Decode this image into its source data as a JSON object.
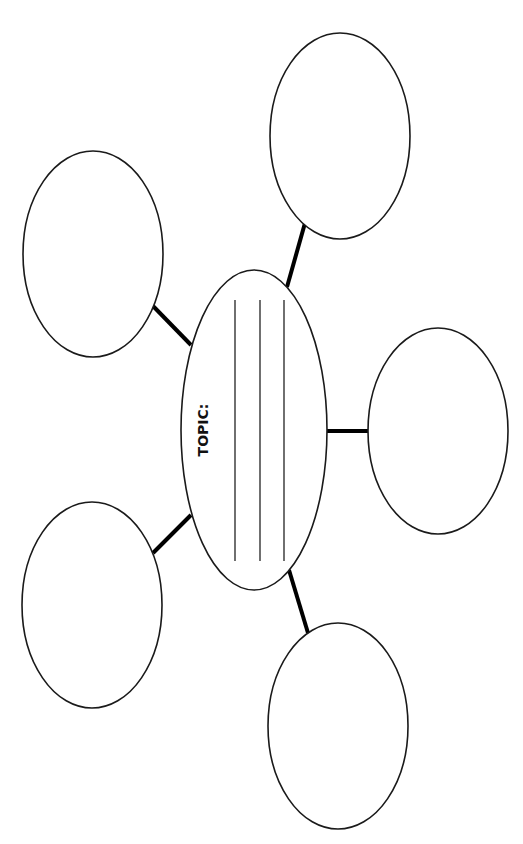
{
  "diagram": {
    "type": "bubble-map",
    "center": {
      "label": "TOPIC:",
      "writing_lines": 3
    },
    "bubbles": [
      {
        "position": "top-right",
        "text": ""
      },
      {
        "position": "top-left",
        "text": ""
      },
      {
        "position": "right",
        "text": ""
      },
      {
        "position": "bottom-left",
        "text": ""
      },
      {
        "position": "bottom-right",
        "text": ""
      }
    ],
    "colors": {
      "stroke": "#1a1a1a",
      "background": "#ffffff"
    }
  }
}
